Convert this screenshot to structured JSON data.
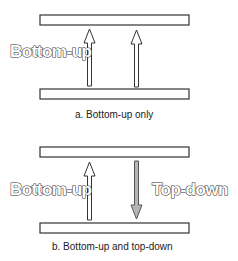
{
  "panels": [
    {
      "id": "a",
      "caption": "a. Bottom-up only",
      "left_label": "Bottom-up",
      "arrows": [
        {
          "direction": "up",
          "style": "hollow"
        },
        {
          "direction": "up",
          "style": "hollow"
        }
      ]
    },
    {
      "id": "b",
      "caption": "b. Bottom-up and top-down",
      "left_label": "Bottom-up",
      "right_label": "Top-down",
      "arrows": [
        {
          "direction": "up",
          "style": "hollow"
        },
        {
          "direction": "down",
          "style": "gray-filled"
        }
      ]
    }
  ],
  "colors": {
    "stroke": "#333333",
    "bar_fill": "#ffffff",
    "down_arrow_fill": "#b5b5b5"
  }
}
